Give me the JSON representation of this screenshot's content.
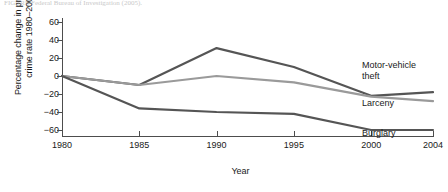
{
  "caption": "FIGURE  Federal Bureau of Investigation (2005).",
  "chart_data": {
    "type": "line",
    "title": "",
    "xlabel": "Year",
    "ylabel": "Percentage change in property crime rate 1980–2004",
    "ylabel_line1": "Percentage change in property",
    "ylabel_line2": "crime rate 1980–2004",
    "x": [
      1980,
      1985,
      1990,
      1995,
      2000,
      2004
    ],
    "categories": [
      "1980",
      "1985",
      "1990",
      "1995",
      "2000",
      "2004"
    ],
    "xlim": [
      1980,
      2004
    ],
    "ylim": [
      -60,
      60
    ],
    "yticks": [
      60,
      40,
      20,
      0,
      -20,
      -40,
      -60
    ],
    "ytick_labels": [
      "60",
      "40",
      "20",
      "0",
      "−20",
      "−40",
      "−60"
    ],
    "grid": false,
    "legend_position": "right-inline",
    "series": [
      {
        "name": "Motor-vehicle theft",
        "label_line1": "Motor-vehicle",
        "label_line2": "theft",
        "color": "#555555",
        "values": [
          0,
          -10,
          31,
          10,
          -22,
          -18
        ]
      },
      {
        "name": "Larceny",
        "label_line1": "Larceny",
        "label_line2": "",
        "color": "#9a9a9a",
        "values": [
          0,
          -10,
          0,
          -7,
          -23,
          -28
        ]
      },
      {
        "name": "Burglary",
        "label_line1": "Burglary",
        "label_line2": "",
        "color": "#555555",
        "values": [
          0,
          -36,
          -40,
          -42,
          -60,
          -60
        ]
      }
    ]
  }
}
